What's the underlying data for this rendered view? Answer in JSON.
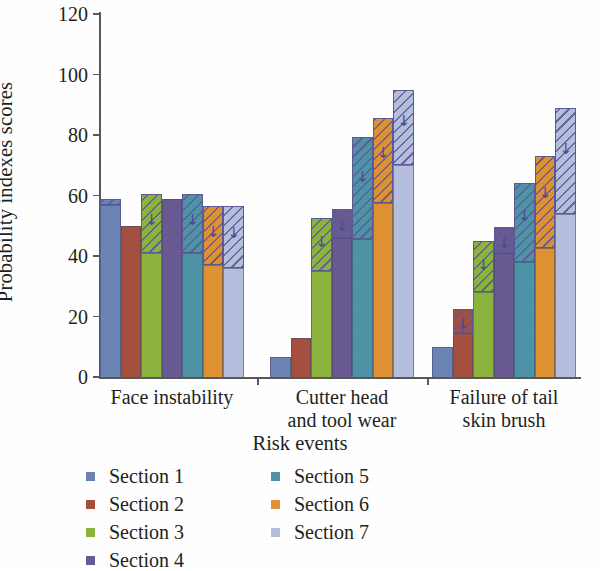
{
  "chart_data": {
    "type": "bar",
    "title": "",
    "xlabel": "Risk events",
    "ylabel": "Probability indexes scores",
    "ylim": [
      0,
      120
    ],
    "yticks": [
      0,
      20,
      40,
      60,
      80,
      100,
      120
    ],
    "grid": false,
    "legend_position": "bottom",
    "categories": [
      "Face instability",
      "Cutter head and tool wear",
      "Failure of tail skin brush"
    ],
    "category_lines": [
      [
        "Face instability"
      ],
      [
        "Cutter head",
        "and tool wear"
      ],
      [
        "Failure of tail",
        "skin brush"
      ]
    ],
    "series": [
      {
        "name": "Section 1",
        "color": "#6b84b4",
        "values": [
          59,
          6.5,
          10
        ],
        "solid_values": [
          57,
          6.5,
          10
        ],
        "hatched": [
          true,
          false,
          false
        ]
      },
      {
        "name": "Section 2",
        "color": "#a5503f",
        "values": [
          50,
          13,
          22.5
        ],
        "solid_values": [
          50,
          13,
          14.5
        ],
        "hatched": [
          false,
          false,
          true
        ]
      },
      {
        "name": "Section 3",
        "color": "#8db33f",
        "values": [
          60.5,
          52.5,
          45
        ],
        "solid_values": [
          41,
          35,
          28
        ],
        "hatched": [
          true,
          true,
          true
        ]
      },
      {
        "name": "Section 4",
        "color": "#6a5a93",
        "values": [
          59,
          55.5,
          49.5
        ],
        "solid_values": [
          59,
          46,
          41
        ],
        "hatched": [
          false,
          true,
          true
        ]
      },
      {
        "name": "Section 5",
        "color": "#4e94a6",
        "values": [
          60.5,
          79.5,
          64
        ],
        "solid_values": [
          41,
          45.5,
          38
        ],
        "hatched": [
          true,
          true,
          true
        ]
      },
      {
        "name": "Section 6",
        "color": "#e09232",
        "values": [
          56.5,
          85.5,
          73
        ],
        "solid_values": [
          37,
          57.5,
          42.5
        ],
        "hatched": [
          true,
          true,
          true
        ]
      },
      {
        "name": "Section 7",
        "color": "#b5bedd",
        "values": [
          56.5,
          95,
          89
        ],
        "solid_values": [
          36,
          70,
          54
        ],
        "hatched": [
          true,
          true,
          true
        ]
      }
    ],
    "legend_entries": [
      {
        "label": "Section 1",
        "color": "#6b84b4"
      },
      {
        "label": "Section 2",
        "color": "#a5503f"
      },
      {
        "label": "Section 3",
        "color": "#8db33f"
      },
      {
        "label": "Section 4",
        "color": "#6a5a93"
      },
      {
        "label": "Section 5",
        "color": "#4e94a6"
      },
      {
        "label": "Section 6",
        "color": "#e09232"
      },
      {
        "label": "Section 7",
        "color": "#b5bedd"
      }
    ],
    "hatch_arrow_glyph": "↓",
    "axis_color": "#58585a",
    "hatch_outline_color": "#5b5a96"
  }
}
